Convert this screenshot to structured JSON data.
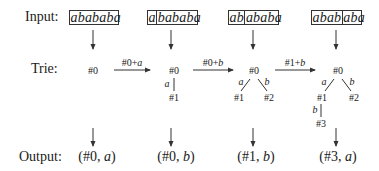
{
  "rows": {
    "input_label": "Input:",
    "trie_label": "Trie:",
    "output_label": "Output:"
  },
  "steps": [
    {
      "input": {
        "segments": [
          "abababa"
        ]
      },
      "trie": {
        "nodes": [
          "#0"
        ],
        "edges": []
      },
      "output": {
        "prefix": "(#0, ",
        "char": "a",
        "suffix": ")"
      }
    },
    {
      "transition": {
        "node": "#0+",
        "char": "a"
      },
      "input": {
        "segments": [
          "a",
          "bababa"
        ]
      },
      "trie": {
        "nodes": [
          "#0",
          "#1"
        ],
        "edges": [
          {
            "from": "#0",
            "to": "#1",
            "label": "a"
          }
        ]
      },
      "output": {
        "prefix": "(#0, ",
        "char": "b",
        "suffix": ")"
      }
    },
    {
      "transition": {
        "node": "#0+",
        "char": "b"
      },
      "input": {
        "segments": [
          "ab",
          "ababa"
        ]
      },
      "trie": {
        "nodes": [
          "#0",
          "#1",
          "#2"
        ],
        "edges": [
          {
            "from": "#0",
            "to": "#1",
            "label": "a"
          },
          {
            "from": "#0",
            "to": "#2",
            "label": "b"
          }
        ]
      },
      "output": {
        "prefix": "(#1, ",
        "char": "b",
        "suffix": ")"
      }
    },
    {
      "transition": {
        "node": "#1+",
        "char": "b"
      },
      "input": {
        "segments": [
          "abab",
          "aba"
        ]
      },
      "trie": {
        "nodes": [
          "#0",
          "#1",
          "#2",
          "#3"
        ],
        "edges": [
          {
            "from": "#0",
            "to": "#1",
            "label": "a"
          },
          {
            "from": "#0",
            "to": "#2",
            "label": "b"
          },
          {
            "from": "#1",
            "to": "#3",
            "label": "b"
          }
        ]
      },
      "output": {
        "prefix": "(#3, ",
        "char": "a",
        "suffix": ")"
      }
    }
  ]
}
